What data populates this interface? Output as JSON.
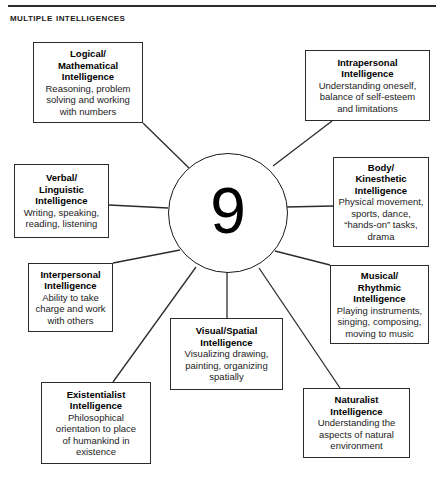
{
  "page": {
    "title": "Multiple Intelligences",
    "center_label": "9"
  },
  "diagram": {
    "type": "radial-hub-and-spoke",
    "hub": "9",
    "nodes": [
      {
        "id": "logical-mathematical",
        "title": "Logical/\nMathematical\nIntelligence",
        "desc": "Reasoning, problem\nsolving and working\nwith numbers",
        "x": 33,
        "y": 42,
        "w": 110,
        "h": 81
      },
      {
        "id": "intrapersonal",
        "title": "Intrapersonal\nIntelligence",
        "desc": "Understanding oneself,\nbalance of self-esteem\nand limitations",
        "x": 305,
        "y": 50,
        "w": 125,
        "h": 71
      },
      {
        "id": "verbal-linguistic",
        "title": "Verbal/\nLinguistic\nIntelligence",
        "desc": "Writing, speaking,\nreading, listening",
        "x": 14,
        "y": 164,
        "w": 95,
        "h": 74
      },
      {
        "id": "body-kinesthetic",
        "title": "Body/\nKinesthetic\nIntelligence",
        "desc": "Physical movement,\nsports, dance,\n“hands-on” tasks,\ndrama",
        "x": 333,
        "y": 157,
        "w": 96,
        "h": 90
      },
      {
        "id": "interpersonal",
        "title": "Interpersonal\nIntelligence",
        "desc": "Ability to take\ncharge and work\nwith others",
        "x": 28,
        "y": 263,
        "w": 85,
        "h": 69
      },
      {
        "id": "musical-rhythmic",
        "title": "Musical/\nRhythmic\nIntelligence",
        "desc": "Playing instruments,\nsinging, composing,\nmoving to music",
        "x": 330,
        "y": 265,
        "w": 99,
        "h": 79
      },
      {
        "id": "visual-spatial",
        "title": "Visual/Spatial\nIntelligence",
        "desc": "Visualizing drawing,\npainting, organizing\nspatially",
        "x": 170,
        "y": 318,
        "w": 113,
        "h": 72
      },
      {
        "id": "existentialist",
        "title": "Existentialist\nIntelligence",
        "desc": "Philosophical\norientation to place\nof humankind in\nexistence",
        "x": 41,
        "y": 382,
        "w": 110,
        "h": 82
      },
      {
        "id": "naturalist",
        "title": "Naturalist\nIntelligence",
        "desc": "Understanding the\naspects of natural\nenvironment",
        "x": 303,
        "y": 388,
        "w": 107,
        "h": 70
      }
    ],
    "connectors": [
      {
        "id": "connector-logical-mathematical",
        "x1": 143,
        "y1": 123,
        "x2": 189,
        "y2": 168
      },
      {
        "id": "connector-intrapersonal",
        "x1": 332,
        "y1": 121,
        "x2": 273,
        "y2": 166
      },
      {
        "id": "connector-verbal-linguistic",
        "x1": 109,
        "y1": 205,
        "x2": 168,
        "y2": 208
      },
      {
        "id": "connector-body-kinesthetic",
        "x1": 333,
        "y1": 206,
        "x2": 286,
        "y2": 207
      },
      {
        "id": "connector-interpersonal",
        "x1": 113,
        "y1": 263,
        "x2": 180,
        "y2": 250
      },
      {
        "id": "connector-musical-rhythmic",
        "x1": 330,
        "y1": 265,
        "x2": 275,
        "y2": 251
      },
      {
        "id": "connector-visual-spatial",
        "x1": 227,
        "y1": 318,
        "x2": 227,
        "y2": 271
      },
      {
        "id": "connector-existentialist",
        "x1": 113,
        "y1": 382,
        "x2": 196,
        "y2": 267
      },
      {
        "id": "connector-naturalist",
        "x1": 340,
        "y1": 388,
        "x2": 259,
        "y2": 268
      }
    ]
  },
  "colors": {
    "border": "#2b2b2b",
    "rule": "#2a2a2a",
    "text": "#111111",
    "background": "#ffffff"
  }
}
